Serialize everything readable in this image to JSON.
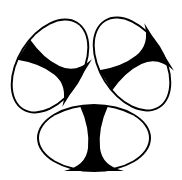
{
  "figure": {
    "colors": {
      "ink": "#000000",
      "paper": "#ffffff"
    },
    "ovals": [
      {
        "name": "top-left",
        "cx": 50,
        "cy": 66,
        "rx": 52,
        "ry": 33,
        "rotate": -58
      },
      {
        "name": "top-right",
        "cx": 132,
        "cy": 64,
        "rx": 52,
        "ry": 33,
        "rotate": 58
      },
      {
        "name": "bottom",
        "cx": 94,
        "cy": 138,
        "rx": 57,
        "ry": 34,
        "rotate": 0
      }
    ]
  }
}
